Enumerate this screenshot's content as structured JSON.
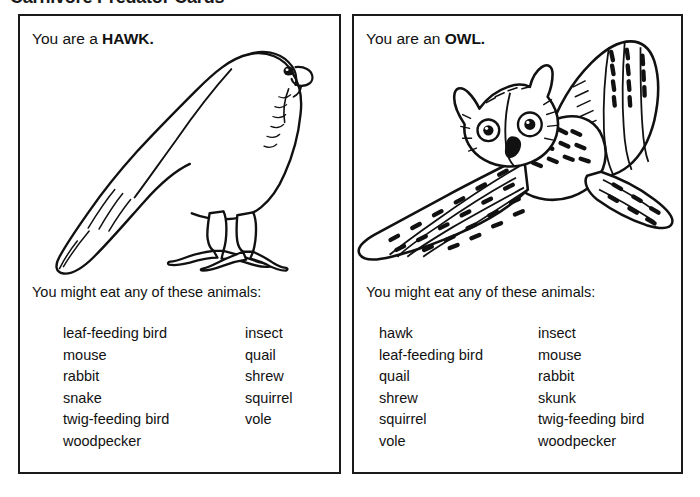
{
  "worksheet": {
    "title": "Carnivore Predator Cards"
  },
  "cards": [
    {
      "id": "hawk",
      "heading_prefix": "You are a ",
      "heading_animal": "HAWK.",
      "illustration": "perched-hawk-line-drawing",
      "prompt": "You might eat any of these animals:",
      "prey_column_1": [
        "leaf-feeding bird",
        "mouse",
        "rabbit",
        "snake",
        "twig-feeding bird",
        "woodpecker"
      ],
      "prey_column_2": [
        "insect",
        "quail",
        "shrew",
        "squirrel",
        "vole"
      ]
    },
    {
      "id": "owl",
      "heading_prefix": "You are an ",
      "heading_animal": "OWL.",
      "illustration": "flying-owl-line-drawing",
      "prompt": "You might eat any of these animals:",
      "prey_column_1": [
        "hawk",
        "leaf-feeding bird",
        "quail",
        "shrew",
        "squirrel",
        "vole"
      ],
      "prey_column_2": [
        "insect",
        "mouse",
        "rabbit",
        "skunk",
        "twig-feeding bird",
        "woodpecker"
      ]
    }
  ],
  "colors": {
    "ink": "#1a1a1a",
    "paper": "#ffffff"
  }
}
